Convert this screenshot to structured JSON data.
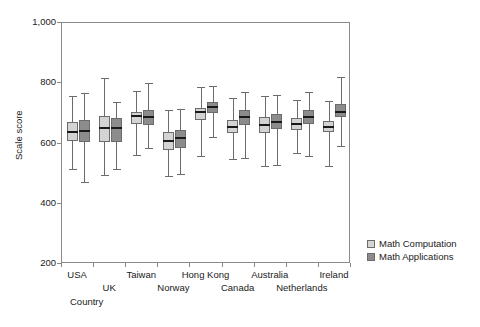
{
  "chart_data": {
    "type": "box",
    "title": "",
    "xlabel": "Country",
    "ylabel": "Scale score",
    "ylim": [
      200,
      1000
    ],
    "ytick_labels": [
      "200",
      "400",
      "600",
      "800",
      "1,000"
    ],
    "ytick_values": [
      200,
      400,
      600,
      800,
      1000
    ],
    "grid": false,
    "legend_position": "right",
    "categories": [
      "USA",
      "UK",
      "Taiwan",
      "Norway",
      "Hong Kong",
      "Canada",
      "Australia",
      "Netherlands",
      "Ireland"
    ],
    "colors": {
      "math_computation": "#d4d4d4",
      "math_applications": "#8c8c8c",
      "axis": "#8a8a8a",
      "box_outline": "#6b6b6b",
      "median": "#1a1a1a",
      "text": "#1a1a1a",
      "background": "#ffffff"
    },
    "series": [
      {
        "name": "Math Computation",
        "color": "#d4d4d4",
        "boxes": [
          {
            "category": "USA",
            "whisker_low": 515,
            "q1": 608,
            "median": 638,
            "q3": 672,
            "whisker_high": 758
          },
          {
            "category": "UK",
            "whisker_low": 495,
            "q1": 605,
            "median": 650,
            "q3": 692,
            "whisker_high": 818
          },
          {
            "category": "Taiwan",
            "whisker_low": 562,
            "q1": 665,
            "median": 692,
            "q3": 705,
            "whisker_high": 775
          },
          {
            "category": "Norway",
            "whisker_low": 492,
            "q1": 578,
            "median": 608,
            "q3": 638,
            "whisker_high": 712
          },
          {
            "category": "Hong Kong",
            "whisker_low": 560,
            "q1": 678,
            "median": 705,
            "q3": 718,
            "whisker_high": 788
          },
          {
            "category": "Canada",
            "whisker_low": 548,
            "q1": 635,
            "median": 655,
            "q3": 678,
            "whisker_high": 752
          },
          {
            "category": "Australia",
            "whisker_low": 525,
            "q1": 635,
            "median": 660,
            "q3": 688,
            "whisker_high": 758
          },
          {
            "category": "Netherlands",
            "whisker_low": 568,
            "q1": 645,
            "median": 665,
            "q3": 685,
            "whisker_high": 745
          },
          {
            "category": "Ireland",
            "whisker_low": 525,
            "q1": 638,
            "median": 655,
            "q3": 675,
            "whisker_high": 742
          }
        ]
      },
      {
        "name": "Math Applications",
        "color": "#8c8c8c",
        "boxes": [
          {
            "category": "USA",
            "whisker_low": 472,
            "q1": 605,
            "median": 642,
            "q3": 678,
            "whisker_high": 768
          },
          {
            "category": "UK",
            "whisker_low": 515,
            "q1": 605,
            "median": 652,
            "q3": 685,
            "whisker_high": 738
          },
          {
            "category": "Taiwan",
            "whisker_low": 585,
            "q1": 662,
            "median": 688,
            "q3": 712,
            "whisker_high": 800
          },
          {
            "category": "Norway",
            "whisker_low": 498,
            "q1": 585,
            "median": 618,
            "q3": 645,
            "whisker_high": 715
          },
          {
            "category": "Hong Kong",
            "whisker_low": 622,
            "q1": 702,
            "median": 722,
            "q3": 738,
            "whisker_high": 790
          },
          {
            "category": "Canada",
            "whisker_low": 552,
            "q1": 660,
            "median": 688,
            "q3": 712,
            "whisker_high": 772
          },
          {
            "category": "Australia",
            "whisker_low": 530,
            "q1": 648,
            "median": 672,
            "q3": 698,
            "whisker_high": 762
          },
          {
            "category": "Netherlands",
            "whisker_low": 560,
            "q1": 665,
            "median": 688,
            "q3": 712,
            "whisker_high": 770
          },
          {
            "category": "Ireland",
            "whisker_low": 592,
            "q1": 688,
            "median": 705,
            "q3": 730,
            "whisker_high": 822
          }
        ]
      }
    ],
    "legend": [
      {
        "label": "Math Computation",
        "color": "#d4d4d4"
      },
      {
        "label": "Math Applications",
        "color": "#8c8c8c"
      }
    ]
  }
}
